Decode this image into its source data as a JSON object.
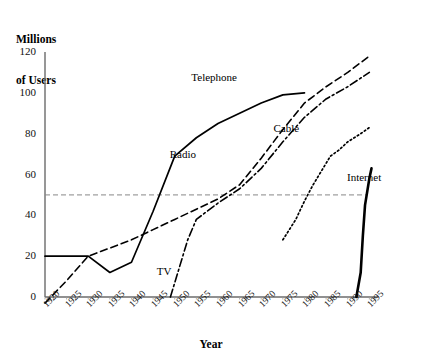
{
  "chart_data": {
    "type": "line",
    "title": "",
    "ylabel": "Millions\nof Users",
    "ylabel_line1": "Millions",
    "ylabel_line2": "of Users",
    "xlabel": "Year",
    "xlim": [
      1920,
      1997
    ],
    "ylim": [
      0,
      120
    ],
    "yticks": [
      0,
      20,
      40,
      60,
      80,
      100,
      120
    ],
    "xticks": [
      1920,
      1925,
      1930,
      1935,
      1940,
      1945,
      1950,
      1955,
      1960,
      1965,
      1970,
      1975,
      1980,
      1985,
      1990,
      1995
    ],
    "grid": false,
    "legend_position": "inline-annotations",
    "reference_line": {
      "orientation": "horizontal",
      "value": 50,
      "style": "dashed"
    },
    "series": [
      {
        "name": "Telephone",
        "style": "solid",
        "label_x": 1958,
        "label_y": 107,
        "points": [
          [
            1920,
            20
          ],
          [
            1925,
            20
          ],
          [
            1930,
            20
          ],
          [
            1935,
            12
          ],
          [
            1940,
            17
          ],
          [
            1945,
            42
          ],
          [
            1950,
            69
          ],
          [
            1955,
            78
          ],
          [
            1960,
            85
          ],
          [
            1965,
            90
          ],
          [
            1970,
            95
          ],
          [
            1975,
            99
          ],
          [
            1980,
            100
          ]
        ]
      },
      {
        "name": "Radio",
        "style": "dashed",
        "label_x": 1953,
        "label_y": 69,
        "points": [
          [
            1920,
            -3
          ],
          [
            1925,
            8
          ],
          [
            1930,
            20
          ],
          [
            1935,
            24
          ],
          [
            1940,
            28
          ],
          [
            1945,
            33
          ],
          [
            1950,
            38
          ],
          [
            1955,
            43
          ],
          [
            1960,
            48
          ],
          [
            1965,
            55
          ],
          [
            1970,
            68
          ],
          [
            1975,
            82
          ],
          [
            1980,
            95
          ],
          [
            1985,
            103
          ],
          [
            1990,
            110
          ],
          [
            1995,
            118
          ]
        ]
      },
      {
        "name": "TV",
        "style": "dashdot",
        "label_x": 1950,
        "label_y": 12,
        "points": [
          [
            1949,
            0
          ],
          [
            1951,
            14
          ],
          [
            1953,
            28
          ],
          [
            1955,
            38
          ],
          [
            1960,
            46
          ],
          [
            1965,
            53
          ],
          [
            1970,
            63
          ],
          [
            1975,
            76
          ],
          [
            1980,
            88
          ],
          [
            1985,
            97
          ],
          [
            1990,
            103
          ],
          [
            1995,
            110
          ]
        ]
      },
      {
        "name": "Cable",
        "style": "dotted",
        "label_x": 1977,
        "label_y": 82,
        "points": [
          [
            1975,
            28
          ],
          [
            1978,
            38
          ],
          [
            1980,
            47
          ],
          [
            1982,
            55
          ],
          [
            1984,
            62
          ],
          [
            1986,
            69
          ],
          [
            1988,
            72
          ],
          [
            1990,
            76
          ],
          [
            1993,
            80
          ],
          [
            1995,
            83
          ]
        ]
      },
      {
        "name": "Internet",
        "style": "solid-thick",
        "label_x": 1994,
        "label_y": 58,
        "points": [
          [
            1992,
            0
          ],
          [
            1993,
            12
          ],
          [
            1993.5,
            30
          ],
          [
            1994,
            45
          ],
          [
            1995,
            58
          ],
          [
            1995.5,
            63
          ]
        ]
      }
    ]
  },
  "axis": {
    "y_title_line1": "Millions",
    "y_title_line2": "of Users",
    "x_title": "Year"
  },
  "colors": {
    "line": "#000000",
    "axis": "#6b6b6b",
    "reference": "#888888",
    "background": "#ffffff"
  }
}
